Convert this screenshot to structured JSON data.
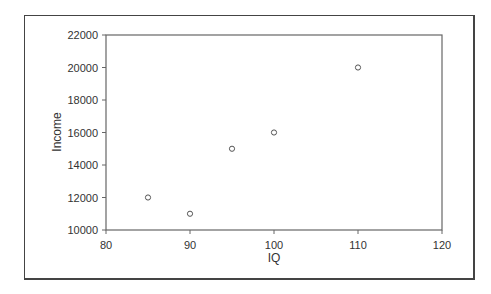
{
  "chart_data": {
    "type": "scatter",
    "title": "",
    "xlabel": "IQ",
    "ylabel": "Income",
    "xlim": [
      80,
      120
    ],
    "ylim": [
      10000,
      22000
    ],
    "x_ticks": [
      "80",
      "90",
      "100",
      "110",
      "120"
    ],
    "y_ticks": [
      "10000",
      "12000",
      "14000",
      "16000",
      "18000",
      "20000",
      "22000"
    ],
    "grid": false,
    "legend": null,
    "points": [
      {
        "x": 85,
        "y": 12000
      },
      {
        "x": 90,
        "y": 11000
      },
      {
        "x": 95,
        "y": 15000
      },
      {
        "x": 100,
        "y": 16000
      },
      {
        "x": 110,
        "y": 20000
      }
    ],
    "marker": "open-circle",
    "colors": {
      "axis": "#666666",
      "marker": "#555555",
      "frame": "#444444"
    }
  }
}
